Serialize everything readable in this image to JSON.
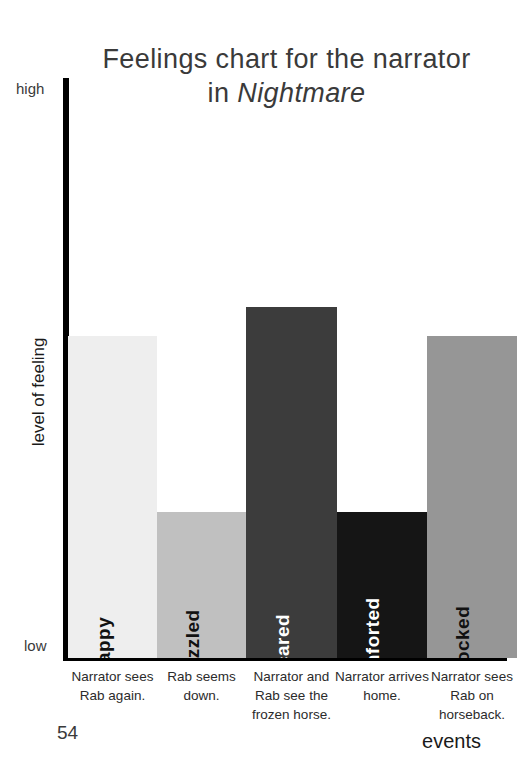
{
  "chart_data": {
    "type": "bar",
    "title": "Feelings chart for the narrator in Nightmare",
    "title_line1": "Feelings chart for the narrator",
    "title_line2_prefix": "in ",
    "title_line2_italic": "Nightmare",
    "xlabel": "events",
    "ylabel": "level of feeling",
    "y_tick_high": "high",
    "y_tick_low": "low",
    "ylim": [
      0,
      100
    ],
    "grid": false,
    "legend": "none",
    "categories": [
      "Narrator sees Rab again.",
      "Rab seems down.",
      "Narrator and Rab see the frozen horse.",
      "Narrator arrives home.",
      "Narrator sees Rab on horseback."
    ],
    "bar_labels": [
      "happy",
      "puzzled",
      "scared",
      "comforted",
      "shocked"
    ],
    "values": [
      55,
      25,
      60,
      25,
      55
    ],
    "colors": [
      "#eeeeee",
      "#c0c0c0",
      "#3c3c3c",
      "#151515",
      "#969696"
    ],
    "label_colors": [
      "dark",
      "dark",
      "light",
      "light",
      "dark"
    ],
    "note_last_category_clipped": true
  },
  "page": {
    "number": "54"
  }
}
